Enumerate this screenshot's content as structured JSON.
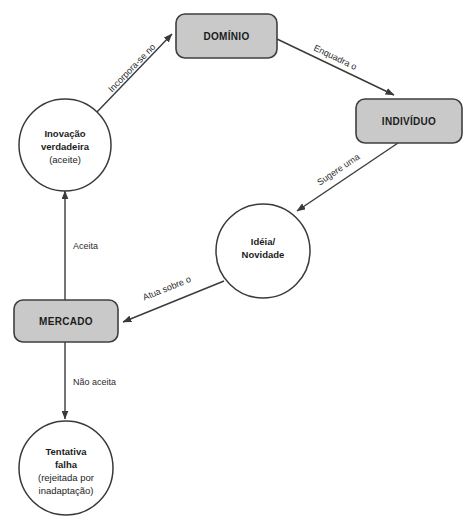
{
  "diagram": {
    "type": "cycle-flow-diagram",
    "background_color": "#ffffff",
    "box_fill_color": "#c9c9c9",
    "box_stroke_color": "#3f3f3f",
    "circle_fill_color": "#ffffff",
    "circle_stroke_color": "#3a3a3a",
    "line_color": "#3a3a3a",
    "nodes": [
      {
        "id": "dominio",
        "shape": "rounded-rectangle",
        "label": "DOMÍNIO",
        "lines": [
          "DOMÍNIO"
        ]
      },
      {
        "id": "individuo",
        "shape": "rounded-rectangle",
        "label": "INDIVÍDUO",
        "lines": [
          "INDIVÍDUO"
        ]
      },
      {
        "id": "mercado",
        "shape": "rounded-rectangle",
        "label": "MERCADO",
        "lines": [
          "MERCADO"
        ]
      },
      {
        "id": "ideia",
        "shape": "circle",
        "label": "Idéia/ Novidade",
        "line1": "Idéia/",
        "line2": "Novidade"
      },
      {
        "id": "inovacao",
        "shape": "circle",
        "label": "Inovação verdadeira (aceite)",
        "line1": "Inovação",
        "line2": "verdadeira",
        "line3": "(aceite)"
      },
      {
        "id": "tentativa",
        "shape": "circle",
        "label": "Tentativa falha (rejeitada por inadaptação)",
        "line1": "Tentativa",
        "line2": "falha",
        "line3": "(rejeitada por",
        "line4": "inadaptação)"
      }
    ],
    "edges": [
      {
        "id": "e1",
        "from": "dominio",
        "to": "individuo",
        "label": "Enquadra o"
      },
      {
        "id": "e2",
        "from": "individuo",
        "to": "ideia",
        "label": "Sugere uma"
      },
      {
        "id": "e3",
        "from": "ideia",
        "to": "mercado",
        "label": "Atua sobre o"
      },
      {
        "id": "e4",
        "from": "mercado",
        "to": "inovacao",
        "label": "Aceita"
      },
      {
        "id": "e5",
        "from": "mercado",
        "to": "tentativa",
        "label": "Não aceita"
      },
      {
        "id": "e6",
        "from": "inovacao",
        "to": "dominio",
        "label": "Incorpora-se no"
      }
    ]
  }
}
